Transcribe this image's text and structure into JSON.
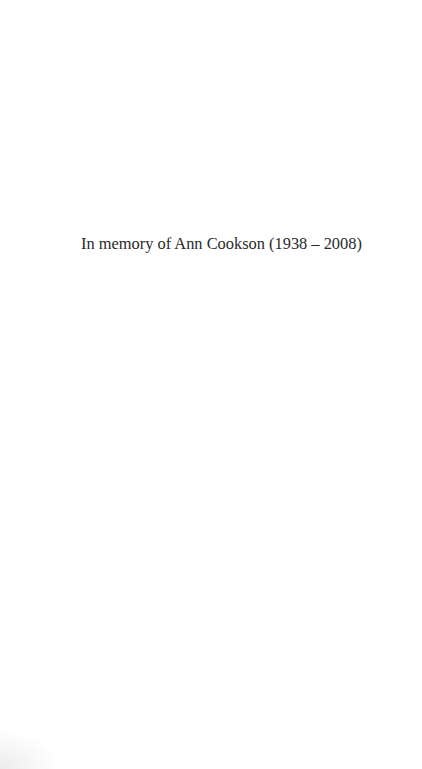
{
  "page": {
    "dedication": "In memory of Ann Cookson (1938 – 2008)",
    "text_color": "#2a2a2a",
    "background_color": "#ffffff"
  }
}
